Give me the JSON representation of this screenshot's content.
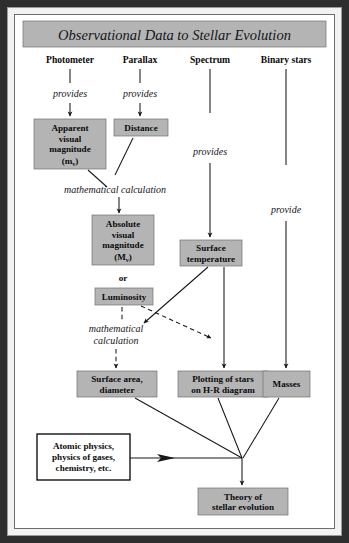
{
  "figure": {
    "title": "Observational Data to Stellar Evolution"
  },
  "columns": [
    {
      "label": "Photometer"
    },
    {
      "label": "Parallax"
    },
    {
      "label": "Spectrum"
    },
    {
      "label": "Binary stars"
    }
  ],
  "edge_labels": {
    "photometer_provides": "provides",
    "parallax_provides": "provides",
    "spectrum_provides": "provides",
    "binary_provide": "provide",
    "math_calc_upper_line1": "mathematical calculation",
    "math_calc_lower_line1": "mathematical",
    "math_calc_lower_line2": "calculation",
    "or": "or"
  },
  "boxes": {
    "apparent_magnitude": {
      "line1": "Apparent",
      "line2": "visual",
      "line3": "magnitude",
      "line4_prefix": "(m",
      "line4_sub": "v",
      "line4_suffix": ")"
    },
    "distance": {
      "line1": "Distance"
    },
    "absolute_magnitude": {
      "line1": "Absolute",
      "line2": "visual",
      "line3": "magnitude",
      "line4_prefix": "(M",
      "line4_sub": "v",
      "line4_suffix": ")"
    },
    "luminosity": {
      "line1": "Luminosity"
    },
    "surface_temperature": {
      "line1": "Surface",
      "line2": "temperature"
    },
    "surface_area": {
      "line1": "Surface area,",
      "line2": "diameter"
    },
    "hr_diagram": {
      "line1": "Plotting of stars",
      "line2": "on H-R diagram"
    },
    "masses": {
      "line1": "Masses"
    },
    "atomic_physics": {
      "line1": "Atomic physics,",
      "line2": "physics of gases,",
      "line3": "chemistry, etc."
    },
    "theory": {
      "line1": "Theory of",
      "line2": "stellar evolution"
    }
  },
  "colors": {
    "box_gray": "#b4b4b4",
    "box_border": "#6f6f6f",
    "white_box_border": "#000000",
    "line": "#17181c",
    "frame": "#2e2e2e",
    "mat": "#f2f2f0"
  }
}
